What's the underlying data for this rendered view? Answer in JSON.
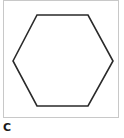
{
  "figure": {
    "label": "C",
    "shape": "hexagon",
    "stroke_color": "#2a2a2a",
    "border_color": "#c8c8c8",
    "points": "9,60 33,14 84,14 109,60 84,105 33,105"
  }
}
